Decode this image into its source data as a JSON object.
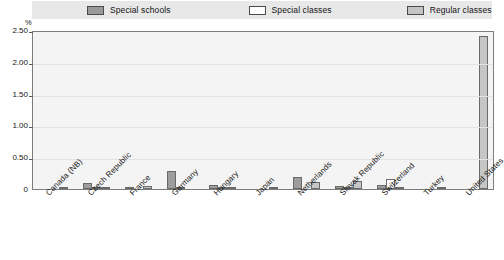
{
  "axis": {
    "unit_label": "%",
    "y_ticks": [
      "2.50",
      "2.00",
      "1.50",
      "1.00",
      "0.50",
      "0"
    ]
  },
  "legend": {
    "items": [
      {
        "label": "Special schools",
        "swatch": "dark-gray-swatch",
        "color": "#9a9a9a"
      },
      {
        "label": "Special classes",
        "swatch": "white-swatch",
        "color": "#ffffff"
      },
      {
        "label": "Regular classes",
        "swatch": "light-gray-swatch",
        "color": "#c4c4c4"
      }
    ]
  },
  "chart_data": {
    "type": "bar",
    "title": "",
    "subtitle": "",
    "xlabel": "",
    "ylabel": "%",
    "ylim": [
      0,
      2.5
    ],
    "ytick_step": 0.5,
    "grid": true,
    "legend_position": "top",
    "categories": [
      "Canada (NB)",
      "Czech Republic",
      "France",
      "Germany",
      "Hungary",
      "Japan",
      "Netherlands",
      "Slovak Republic",
      "Switzerland",
      "Turkey",
      "United States"
    ],
    "series": [
      {
        "name": "Special schools",
        "values": [
          0.0,
          0.1,
          0.03,
          0.28,
          0.07,
          0.0,
          0.19,
          0.04,
          0.06,
          0.0,
          0.0
        ]
      },
      {
        "name": "Special classes",
        "values": [
          0.0,
          0.01,
          0.0,
          0.02,
          0.01,
          0.0,
          0.0,
          0.01,
          0.15,
          0.0,
          0.0
        ]
      },
      {
        "name": "Regular classes",
        "values": [
          0.02,
          0.01,
          0.05,
          0.0,
          0.02,
          0.03,
          0.11,
          0.13,
          0.03,
          0.01,
          2.4
        ]
      }
    ]
  }
}
